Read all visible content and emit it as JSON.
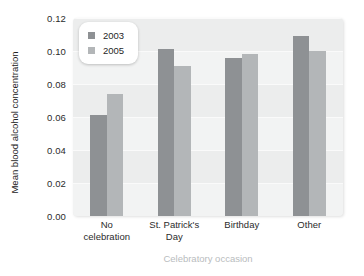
{
  "chart_data": {
    "type": "bar",
    "title": "",
    "xlabel": "Celebratory occasion",
    "ylabel": "Mean blood alcohol concentration",
    "categories": [
      "No celebration",
      "St. Patrick's Day",
      "Birthday",
      "Other"
    ],
    "series": [
      {
        "name": "2003",
        "color": "#8e9194",
        "values": [
          0.061,
          0.101,
          0.096,
          0.109
        ]
      },
      {
        "name": "2005",
        "color": "#b3b6b8",
        "values": [
          0.074,
          0.091,
          0.098,
          0.1
        ]
      }
    ],
    "ylim": [
      0.0,
      0.12
    ],
    "yticks": [
      0.0,
      0.02,
      0.04,
      0.06,
      0.08,
      0.1,
      0.12
    ],
    "ytick_labels": [
      "0.00",
      "0.02",
      "0.04",
      "0.06",
      "0.08",
      "0.10",
      "0.12"
    ],
    "grid": true,
    "legend_position": "top-left",
    "plot_background": "#eceded",
    "figure_background": "#ffffff"
  },
  "legend": {
    "entries": [
      {
        "label": "2003"
      },
      {
        "label": "2005"
      }
    ]
  },
  "axis": {
    "y_title": "Mean blood alcohol concentration",
    "x_title": "Celebratory occasion"
  }
}
